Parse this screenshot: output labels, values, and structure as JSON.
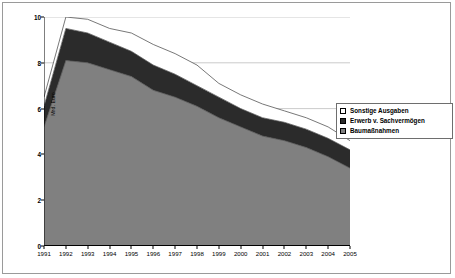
{
  "chart_data": {
    "type": "area",
    "stacked": true,
    "title": "",
    "xlabel": "",
    "ylabel": "Mrd. Euro",
    "ylim": [
      0,
      10
    ],
    "y_ticks": [
      0,
      2,
      4,
      6,
      8,
      10
    ],
    "grid": "horizontal",
    "legend_position": "right",
    "categories": [
      "1991",
      "1992",
      "1993",
      "1994",
      "1995",
      "1996",
      "1997",
      "1998",
      "1999",
      "2000",
      "2001",
      "2002",
      "2003",
      "2004",
      "2005"
    ],
    "series": [
      {
        "name": "Baumaßnahmen",
        "color": "#808080",
        "values": [
          5.2,
          8.1,
          8.0,
          7.7,
          7.4,
          6.8,
          6.5,
          6.1,
          5.6,
          5.2,
          4.8,
          4.6,
          4.3,
          3.9,
          3.4
        ]
      },
      {
        "name": "Erwerb v. Sachvermögen",
        "color": "#2b2b2b",
        "values": [
          0.9,
          1.4,
          1.3,
          1.2,
          1.1,
          1.1,
          1.0,
          0.9,
          0.9,
          0.8,
          0.8,
          0.8,
          0.8,
          0.8,
          0.8
        ]
      },
      {
        "name": "Sonstige Ausgaben",
        "color": "#ffffff",
        "values": [
          0.4,
          0.5,
          0.6,
          0.6,
          0.8,
          0.9,
          0.9,
          0.9,
          0.6,
          0.6,
          0.6,
          0.5,
          0.5,
          0.5,
          0.4
        ]
      }
    ],
    "totals": [
      6.5,
      10.0,
      9.9,
      9.5,
      9.3,
      8.8,
      8.4,
      7.9,
      7.1,
      6.6,
      6.2,
      5.9,
      5.6,
      5.2,
      4.6
    ]
  },
  "legend": {
    "items": [
      {
        "label": "Sonstige Ausgaben",
        "color": "#ffffff"
      },
      {
        "label": "Erwerb v. Sachvermögen",
        "color": "#2b2b2b"
      },
      {
        "label": "Baumaßnahmen",
        "color": "#808080"
      }
    ]
  },
  "axes": {
    "y_title": "Mrd. Euro"
  },
  "colors": {
    "frame": "#9a9a9a",
    "axis": "#000000",
    "gridline": "#b5b5b5",
    "outline": "#555555",
    "background": "#ffffff"
  }
}
